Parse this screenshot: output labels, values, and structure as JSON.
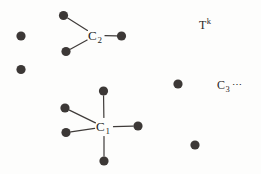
{
  "figure": {
    "width": 261,
    "height": 174,
    "background_color": "#fdfdfc",
    "dot_color": "#3c3836",
    "edge_color": "#3f3b39",
    "text_color": "#231f1e",
    "dot_radius": 4.6,
    "edge_width": 1.2
  },
  "clusters": [
    {
      "id": "c2",
      "label_base": "C",
      "label_sub": "2",
      "center": {
        "x": 95.5,
        "y": 35.5
      },
      "label_pos": {
        "x": 88,
        "y": 29
      },
      "neighbors": [
        {
          "name": "c2-neighbor-top-left",
          "x": 63.5,
          "y": 15.5
        },
        {
          "name": "c2-neighbor-bottom-left",
          "x": 66.0,
          "y": 51.5
        },
        {
          "name": "c2-neighbor-right",
          "x": 121.5,
          "y": 36.0
        }
      ]
    },
    {
      "id": "c1",
      "label_base": "C",
      "label_sub": "1",
      "center": {
        "x": 104.0,
        "y": 127.0
      },
      "label_pos": {
        "x": 96,
        "y": 120
      },
      "neighbors": [
        {
          "name": "c1-neighbor-top",
          "x": 103.5,
          "y": 91.0
        },
        {
          "name": "c1-neighbor-upper-left",
          "x": 65.0,
          "y": 108.0
        },
        {
          "name": "c1-neighbor-lower-left",
          "x": 66.0,
          "y": 132.5
        },
        {
          "name": "c1-neighbor-right",
          "x": 138.0,
          "y": 126.0
        },
        {
          "name": "c1-neighbor-bottom",
          "x": 104.0,
          "y": 161.0
        }
      ]
    }
  ],
  "isolated_dots": [
    {
      "name": "isolated-dot-left-upper",
      "x": 21.0,
      "y": 36.0
    },
    {
      "name": "isolated-dot-left-lower",
      "x": 21.0,
      "y": 69.5
    },
    {
      "name": "isolated-dot-right-upper",
      "x": 178.0,
      "y": 84.0
    },
    {
      "name": "isolated-dot-right-lower",
      "x": 195.0,
      "y": 145.0
    }
  ],
  "annotations": [
    {
      "name": "label-t-k",
      "base": "T",
      "sup": "k",
      "sub": "",
      "tail": "",
      "x": 199,
      "y": 17
    },
    {
      "name": "label-c-3",
      "base": "C",
      "sup": "",
      "sub": "3",
      "tail": "⋯",
      "x": 217,
      "y": 79
    }
  ]
}
